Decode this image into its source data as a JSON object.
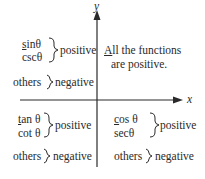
{
  "axes": {
    "x_label": "x",
    "y_label": "y"
  },
  "quadrants": {
    "q1": {
      "first_letter": "A",
      "line1_rest": "ll the functions",
      "line2": "are positive."
    },
    "q2": {
      "fn1_letter": "s",
      "fn1_rest": "inθ",
      "fn2": "cscθ",
      "positive_label": "positive",
      "others_label": "others",
      "negative_label": "negative"
    },
    "q3": {
      "fn1_letter": "t",
      "fn1_rest": "an θ",
      "fn2": "cot θ",
      "positive_label": "positive",
      "others_label": "others",
      "negative_label": "negative"
    },
    "q4": {
      "fn1_letter": "c",
      "fn1_rest": "os θ",
      "fn2": "secθ",
      "positive_label": "positive",
      "others_label": "others",
      "negative_label": "negative"
    }
  },
  "colors": {
    "ink": "#2a2a2a",
    "background": "#ffffff"
  }
}
